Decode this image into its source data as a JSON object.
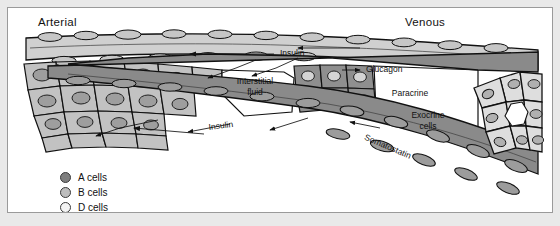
{
  "figure": {
    "headers": [
      {
        "name": "arterial-label",
        "text": "Arterial"
      },
      {
        "name": "venous-label",
        "text": "Venous"
      }
    ],
    "callouts": [
      {
        "name": "insulin-upper-callout",
        "text": "Insulin"
      },
      {
        "name": "glucagon-callout",
        "text": "Glucagon"
      },
      {
        "name": "insulin-lower-callout",
        "text": "Insulin"
      },
      {
        "name": "somatostatin-callout",
        "text": "Somatostatin"
      }
    ],
    "inner_labels": [
      {
        "name": "interstitial-fluid-label",
        "line1": "Interstitial",
        "line2": "fluid"
      },
      {
        "name": "paracrine-label",
        "line1": "Paracrine",
        "line2": ""
      },
      {
        "name": "exocrine-cells-label",
        "line1": "Exocrine",
        "line2": "cells"
      }
    ],
    "legend": {
      "name": "cell-type-legend",
      "items": [
        {
          "name": "legend-item-a-cells",
          "label": "A cells",
          "color": "#7e7e7e"
        },
        {
          "name": "legend-item-b-cells",
          "label": "B cells",
          "color": "#bdbdbd"
        },
        {
          "name": "legend-item-d-cells",
          "label": "D cells",
          "color": "#f4f4f4"
        }
      ]
    },
    "palette": {
      "arterial_vessel": "#d0d0d0",
      "venous_vessel": "#8a8a8a",
      "a_cell": "#8f8f8f",
      "b_cell": "#c2c2c2",
      "d_cell": "#f2f2f2",
      "exocrine_cell": "#dedede",
      "nucleus": "#a6a6a6",
      "outline": "#1a1a1a",
      "background": "#ffffff",
      "frame_border": "#9a9a9a",
      "page_margin": "#e9e9e9"
    }
  }
}
